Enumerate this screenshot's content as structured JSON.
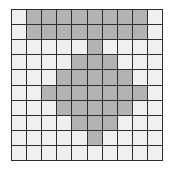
{
  "grid": {
    "rows": 10,
    "cols": 10,
    "colors": {
      "filled": "#b3b3b3",
      "empty": "#f0f0f0",
      "line": "#2e2e2e"
    },
    "cells": [
      [
        0,
        1,
        1,
        1,
        1,
        1,
        1,
        1,
        1,
        0
      ],
      [
        0,
        1,
        1,
        1,
        1,
        1,
        1,
        1,
        1,
        0
      ],
      [
        0,
        0,
        0,
        0,
        0,
        1,
        0,
        0,
        0,
        0
      ],
      [
        0,
        0,
        0,
        0,
        1,
        1,
        1,
        0,
        0,
        0
      ],
      [
        0,
        0,
        0,
        1,
        1,
        1,
        1,
        1,
        0,
        0
      ],
      [
        0,
        0,
        1,
        1,
        1,
        1,
        1,
        1,
        1,
        0
      ],
      [
        0,
        0,
        0,
        1,
        1,
        1,
        1,
        1,
        0,
        0
      ],
      [
        0,
        0,
        0,
        0,
        1,
        1,
        1,
        0,
        0,
        0
      ],
      [
        0,
        0,
        0,
        0,
        0,
        1,
        0,
        0,
        0,
        0
      ],
      [
        0,
        0,
        0,
        0,
        0,
        0,
        0,
        0,
        0,
        0
      ]
    ]
  }
}
